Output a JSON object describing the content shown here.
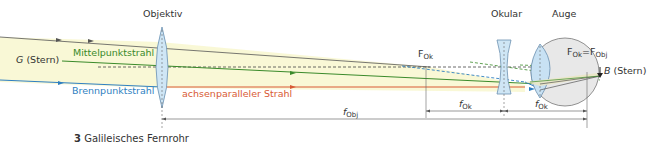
{
  "figure": {
    "number": "3",
    "caption": "Galileisches Fernrohr"
  },
  "labels": {
    "objective": "Objektiv",
    "eyepiece": "Okular",
    "eye": "Auge",
    "object": "G",
    "object_suffix": "(Stern)",
    "image": "B",
    "image_suffix": "(Stern)",
    "center_ray": "Mittelpunktstrahl",
    "focal_ray": "Brennpunktstrahl",
    "parallel_ray": "achsenparalleler Strahl",
    "focal_point_ok": "F",
    "focal_point_ok_sub": "Ok",
    "focal_eq_left": "F",
    "focal_eq_left_sub": "Ok",
    "focal_eq_sep": "=",
    "focal_eq_right": "F",
    "focal_eq_right_sub": "Obj",
    "f_obj": "f",
    "f_obj_sub": "Obj",
    "f_ok_1": "f",
    "f_ok_1_sub": "Ok",
    "f_ok_2": "f",
    "f_ok_2_sub": "Ok"
  },
  "colors": {
    "center_ray": "#3a8a2a",
    "focal_ray": "#2f7fc1",
    "parallel_ray": "#d85a34",
    "beam_fill": "#f7f6cf",
    "lens_fill": "#cfe6f5",
    "eye_fill": "#e6e6e6",
    "axis": "#555555"
  }
}
